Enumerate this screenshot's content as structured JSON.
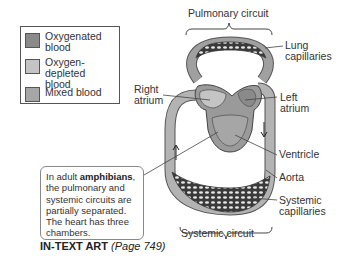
{
  "legend": {
    "items": [
      {
        "label": "Oxygenated blood",
        "line1": "Oxygenated",
        "line2": "blood",
        "color": "#8a8a8a"
      },
      {
        "label": "Oxygen-depleted blood",
        "line1": "Oxygen-depleted",
        "line2": "blood",
        "color": "#c4c4c4"
      },
      {
        "label": "Mixed blood",
        "line1": "Mixed blood",
        "line2": "",
        "color": "#a6a6a6"
      }
    ]
  },
  "diagram": {
    "top_label": "Pulmonary circuit",
    "bottom_label": "Systemic circuit",
    "labels": {
      "lung_capillaries_1": "Lung",
      "lung_capillaries_2": "capillaries",
      "right_atrium_1": "Right",
      "right_atrium_2": "atrium",
      "left_atrium_1": "Left",
      "left_atrium_2": "atrium",
      "ventricle": "Ventricle",
      "aorta": "Aorta",
      "systemic_capillaries_1": "Systemic",
      "systemic_capillaries_2": "capillaries"
    }
  },
  "callout": {
    "prefix": "In adult ",
    "bold": "amphibians",
    "suffix": ", the pulmonary and systemic circuits are partially separated. The heart has three chambers."
  },
  "footer": {
    "title": "IN-TEXT ART",
    "page": "(Page 749)"
  }
}
